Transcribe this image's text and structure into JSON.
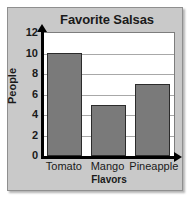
{
  "chart_data": {
    "type": "bar",
    "title": "Favorite Salsas",
    "xlabel": "Flavors",
    "ylabel": "People",
    "categories": [
      "Tomato",
      "Mango",
      "Pineapple"
    ],
    "values": [
      10,
      5,
      7
    ],
    "ylim": [
      0,
      12
    ],
    "ytick_labels": [
      "0",
      "2",
      "4",
      "6",
      "8",
      "10",
      "12"
    ],
    "ytick_values": [
      0,
      2,
      4,
      6,
      8,
      10,
      12
    ],
    "grid": "horizontal",
    "legend": "none",
    "bar_color": "#7a7a7a",
    "bar_edge_color": "#2b2b2b",
    "plot_background": "#ffffff",
    "panel_background": "#c9c9c9",
    "gridline_color": "#a8a8a8",
    "axis_color": "#000000",
    "text_color": "#1a1a1a"
  }
}
